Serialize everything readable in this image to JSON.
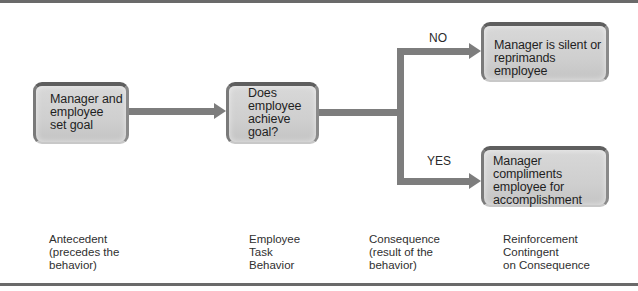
{
  "diagram": {
    "type": "flowchart",
    "boxes": {
      "antecedent": {
        "text": "Manager and\nemployee\nset goal"
      },
      "decision": {
        "text": "Does\nemployee\nachieve\ngoal?"
      },
      "no_outcome": {
        "text": "Manager is silent or\nreprimands employee"
      },
      "yes_outcome": {
        "text": "Manager compliments\nemployee for\naccomplishment"
      }
    },
    "branches": {
      "no": "NO",
      "yes": "YES"
    },
    "columns": [
      {
        "label": "Antecedent\n(precedes the\nbehavior)"
      },
      {
        "label": "Employee\nTask\nBehavior"
      },
      {
        "label": "Consequence\n(result of the\nbehavior)"
      },
      {
        "label": "Reinforcement\nContingent\non Consequence"
      }
    ],
    "edges": [
      {
        "from": "antecedent",
        "to": "decision"
      },
      {
        "from": "decision",
        "to": "no_outcome",
        "label": "NO"
      },
      {
        "from": "decision",
        "to": "yes_outcome",
        "label": "YES"
      }
    ]
  },
  "colors": {
    "arrow": "#7d7d7d",
    "box_fill": "#d2d2d2",
    "box_border": "#5f5f5f",
    "rule": "#6a6a6a"
  }
}
